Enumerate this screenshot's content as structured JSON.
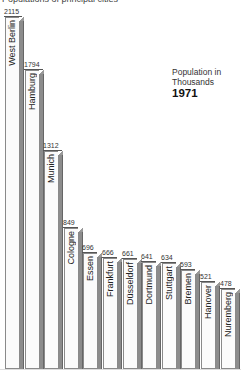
{
  "title": "Populations of principal cities",
  "legend": {
    "line1": "Population in",
    "line2": "Thousands",
    "year": "1971"
  },
  "chart_data": {
    "type": "bar",
    "title": "Populations of principal cities",
    "subtitle": "Population in Thousands 1971",
    "xlabel": "",
    "ylabel": "Population (thousands)",
    "categories": [
      "West Berlin",
      "Hamburg",
      "Munich",
      "Cologne",
      "Essen",
      "Frankfurt",
      "Düsseldorf",
      "Dortmund",
      "Stuttgart",
      "Bremen",
      "Hanover",
      "Nuremberg"
    ],
    "values": [
      2115,
      1794,
      1312,
      849,
      696,
      666,
      661,
      641,
      634,
      593,
      521,
      478
    ],
    "ylim": [
      0,
      2115
    ],
    "grid": false,
    "legend_position": "top-right",
    "orientation": "vertical",
    "label_placement": "vertical text inside bar tops, value above each bar"
  },
  "bars": [
    {
      "name": "West Berlin",
      "value": "2115"
    },
    {
      "name": "Hamburg",
      "value": "1794"
    },
    {
      "name": "Munich",
      "value": "1312"
    },
    {
      "name": "Cologne",
      "value": "849"
    },
    {
      "name": "Essen",
      "value": "696"
    },
    {
      "name": "Frankfurt",
      "value": "666"
    },
    {
      "name": "Düsseldorf",
      "value": "661"
    },
    {
      "name": "Dortmund",
      "value": "641"
    },
    {
      "name": "Stuttgart",
      "value": "634"
    },
    {
      "name": "Bremen",
      "value": "593"
    },
    {
      "name": "Hanover",
      "value": "521"
    },
    {
      "name": "Nuremberg",
      "value": "478"
    }
  ]
}
